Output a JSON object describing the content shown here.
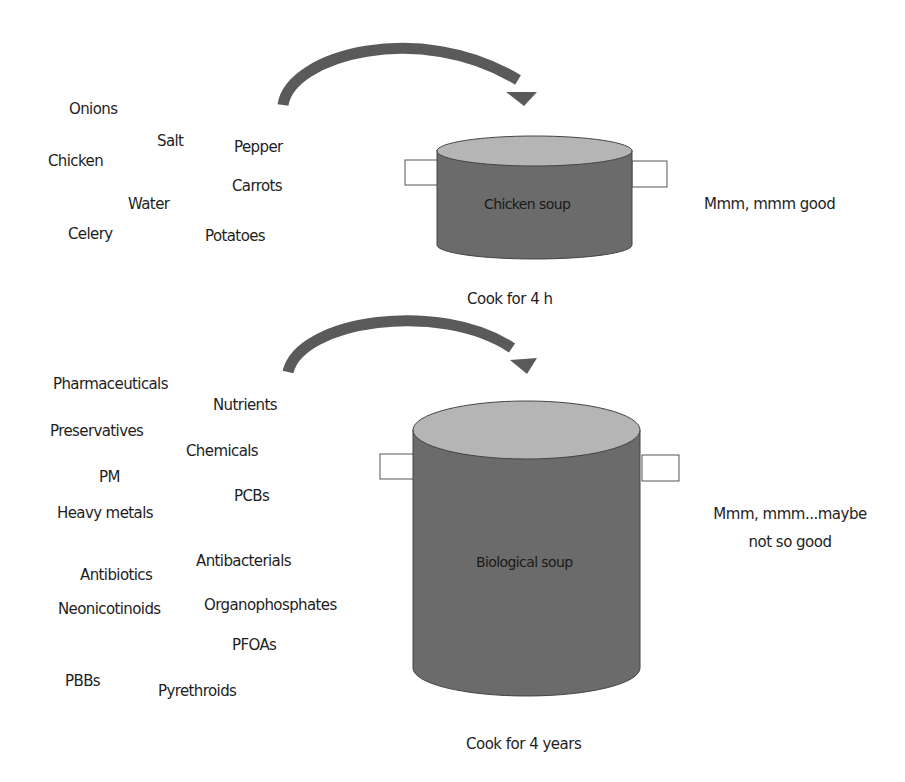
{
  "colors": {
    "pot_body": "#6b6b6b",
    "pot_top": "#b5b5b5",
    "arrow": "#5a5a5a",
    "handle_fill": "#ffffff",
    "handle_stroke": "#555555"
  },
  "top": {
    "ingredients": [
      {
        "text": "Onions",
        "x": 69,
        "y": 100
      },
      {
        "text": "Salt",
        "x": 157,
        "y": 132
      },
      {
        "text": "Pepper",
        "x": 234,
        "y": 138
      },
      {
        "text": "Chicken",
        "x": 48,
        "y": 152
      },
      {
        "text": "Carrots",
        "x": 232,
        "y": 177
      },
      {
        "text": "Water",
        "x": 128,
        "y": 195
      },
      {
        "text": "Celery",
        "x": 68,
        "y": 225
      },
      {
        "text": "Potatoes",
        "x": 205,
        "y": 227
      }
    ],
    "pot_label": "Chicken soup",
    "cook_time": "Cook for 4 h",
    "verdict": "Mmm, mmm good"
  },
  "bottom": {
    "ingredients": [
      {
        "text": "Pharmaceuticals",
        "x": 53,
        "y": 375
      },
      {
        "text": "Nutrients",
        "x": 213,
        "y": 396
      },
      {
        "text": "Preservatives",
        "x": 50,
        "y": 422
      },
      {
        "text": "Chemicals",
        "x": 186,
        "y": 442
      },
      {
        "text": "PM",
        "x": 99,
        "y": 468
      },
      {
        "text": "PCBs",
        "x": 234,
        "y": 487
      },
      {
        "text": "Heavy metals",
        "x": 57,
        "y": 504
      },
      {
        "text": "Antibacterials",
        "x": 196,
        "y": 552
      },
      {
        "text": "Antibiotics",
        "x": 80,
        "y": 566
      },
      {
        "text": "Neonicotinoids",
        "x": 58,
        "y": 600
      },
      {
        "text": "Organophosphates",
        "x": 204,
        "y": 596
      },
      {
        "text": "PFOAs",
        "x": 232,
        "y": 636
      },
      {
        "text": "PBBs",
        "x": 65,
        "y": 672
      },
      {
        "text": "Pyrethroids",
        "x": 158,
        "y": 682
      }
    ],
    "pot_label": "Biological soup",
    "cook_time": "Cook for 4 years",
    "verdict_line1": "Mmm, mmm...maybe",
    "verdict_line2": "not so good"
  }
}
